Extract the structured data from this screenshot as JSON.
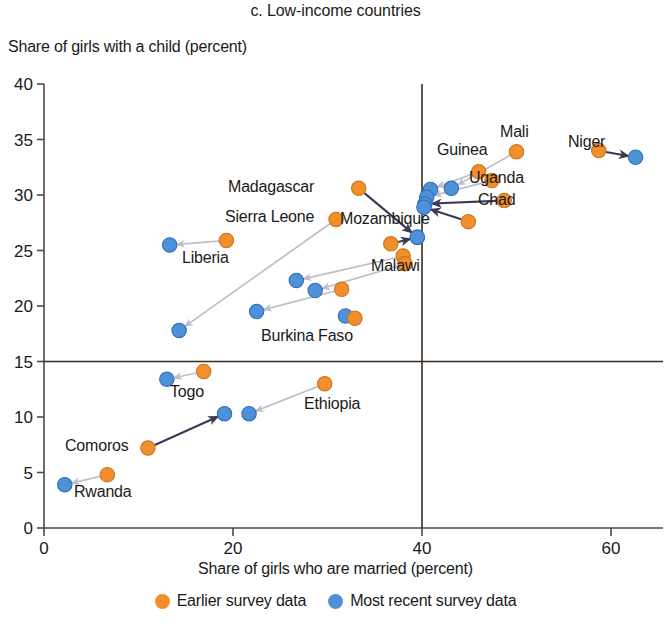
{
  "chart_data": {
    "type": "scatter",
    "title": "c. Low-income countries",
    "xlabel": "Share of girls who are married (percent)",
    "ylabel": "Share of girls with a child (percent)",
    "xlim": [
      0,
      65.5
    ],
    "ylim": [
      0,
      40
    ],
    "xticks": [
      0,
      20,
      40,
      60
    ],
    "yticks": [
      0,
      5,
      10,
      15,
      20,
      25,
      30,
      35,
      40
    ],
    "grid": false,
    "reference_lines": {
      "horizontal": 15,
      "vertical": 40
    },
    "legend_position": "bottom",
    "series": [
      {
        "name": "Earlier survey data",
        "color": "#F28E2B"
      },
      {
        "name": "Most recent survey data",
        "color": "#4E91D9"
      }
    ],
    "points": [
      {
        "label": "Niger",
        "earlier": [
          58.7,
          34.0
        ],
        "recent": [
          62.6,
          33.4
        ],
        "arrow": "dark"
      },
      {
        "label": "Mali",
        "earlier": [
          50.0,
          33.9
        ],
        "recent": [
          43.1,
          30.6
        ],
        "arrow": "light"
      },
      {
        "label": "Guinea",
        "earlier": [
          46.0,
          32.1
        ],
        "recent": [
          40.9,
          30.5
        ],
        "arrow": "light"
      },
      {
        "label": "Uganda",
        "earlier": [
          47.4,
          31.3
        ],
        "recent": [
          40.5,
          29.8
        ],
        "arrow": "light"
      },
      {
        "label": "Chad",
        "earlier": [
          48.7,
          29.5
        ],
        "recent": [
          40.3,
          29.2
        ],
        "arrow": "dark"
      },
      {
        "label": "",
        "earlier": [
          44.9,
          27.6
        ],
        "recent": [
          40.2,
          28.9
        ],
        "arrow": "dark"
      },
      {
        "label": "Madagascar",
        "earlier": [
          33.3,
          30.6
        ],
        "recent": [
          39.5,
          26.2
        ],
        "arrow": "dark"
      },
      {
        "label": "Mozambique",
        "earlier": [
          36.7,
          25.6
        ],
        "recent": [
          39.5,
          26.2
        ],
        "arrow": "dark"
      },
      {
        "label": "Sierra Leone",
        "earlier": [
          30.9,
          27.8
        ],
        "recent": [
          14.3,
          17.8
        ],
        "arrow": "light"
      },
      {
        "label": "Liberia",
        "earlier": [
          19.3,
          25.9
        ],
        "recent": [
          13.3,
          25.5
        ],
        "arrow": "light"
      },
      {
        "label": "Malawi",
        "earlier": [
          38.0,
          24.5
        ],
        "recent": [
          26.7,
          22.3
        ],
        "arrow": "light"
      },
      {
        "label": "",
        "earlier": [
          38.2,
          23.8
        ],
        "recent": [
          28.7,
          21.4
        ],
        "arrow": "light"
      },
      {
        "label": "",
        "earlier": [
          31.5,
          21.5
        ],
        "recent": [
          22.5,
          19.5
        ],
        "arrow": "light"
      },
      {
        "label": "Burkina Faso",
        "earlier": [
          32.9,
          18.9
        ],
        "recent": [
          31.9,
          19.1
        ],
        "arrow": "none"
      },
      {
        "label": "Togo",
        "earlier": [
          16.9,
          14.1
        ],
        "recent": [
          13.0,
          13.4
        ],
        "arrow": "light"
      },
      {
        "label": "Ethiopia",
        "earlier": [
          29.7,
          13.0
        ],
        "recent": [
          21.7,
          10.3
        ],
        "arrow": "light"
      },
      {
        "label": "Comoros",
        "earlier": [
          11.0,
          7.2
        ],
        "recent": [
          19.1,
          10.3
        ],
        "arrow": "dark"
      },
      {
        "label": "Rwanda",
        "earlier": [
          6.7,
          4.8
        ],
        "recent": [
          2.2,
          3.9
        ],
        "arrow": "light"
      }
    ],
    "country_labels": [
      {
        "text": "Madagascar",
        "x": 228,
        "y": 179
      },
      {
        "text": "Sierra Leone",
        "x": 225,
        "y": 209
      },
      {
        "text": "Mozambique",
        "x": 340,
        "y": 211
      },
      {
        "text": "Liberia",
        "x": 182,
        "y": 250
      },
      {
        "text": "Malawi",
        "x": 371,
        "y": 258
      },
      {
        "text": "Burkina Faso",
        "x": 261,
        "y": 328
      },
      {
        "text": "Guinea",
        "x": 437,
        "y": 142
      },
      {
        "text": "Mali",
        "x": 500,
        "y": 124
      },
      {
        "text": "Niger",
        "x": 568,
        "y": 134
      },
      {
        "text": "Uganda",
        "x": 469,
        "y": 170
      },
      {
        "text": "Chad",
        "x": 478,
        "y": 192
      },
      {
        "text": "Togo",
        "x": 170,
        "y": 384
      },
      {
        "text": "Ethiopia",
        "x": 304,
        "y": 396
      },
      {
        "text": "Comoros",
        "x": 65,
        "y": 438
      },
      {
        "text": "Rwanda",
        "x": 74,
        "y": 484
      }
    ]
  },
  "legend": {
    "earlier": "Earlier survey data",
    "recent": "Most recent survey data"
  },
  "colors": {
    "orange": "#F28E2B",
    "blue": "#4E91D9",
    "arrow_light": "#BEBEC8",
    "arrow_dark": "#3A3A55",
    "axis": "#4a4a4a"
  }
}
